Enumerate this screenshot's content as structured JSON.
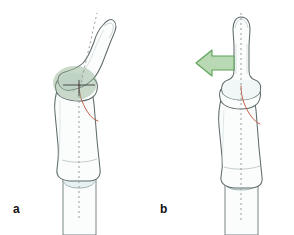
{
  "figure": {
    "type": "medical-illustration",
    "background_color": "#ffffff",
    "panels": [
      {
        "id": "a",
        "label": "a",
        "label_x": 13,
        "label_y": 203,
        "description": "Dorsally angulated distal phalanx with intra-articular fracture of the middle phalanx head; green ellipse marks the displaced joint region.",
        "state": "displaced",
        "axis": {
          "type": "dashed-reference-axis",
          "color": "#9a9a9a",
          "dash": "2,3",
          "segments": [
            {
              "name": "proximal-shaft-axis",
              "x1": 79,
              "y1": 215,
              "x2": 79,
              "y2": 92
            },
            {
              "name": "distal-phalanx-axis",
              "x1": 79,
              "y1": 92,
              "x2": 96,
              "y2": 14
            }
          ]
        },
        "highlight": {
          "shape": "ellipse",
          "cx": 75,
          "cy": 83,
          "rx": 22,
          "ry": 17,
          "fill": "#8aab8a",
          "opacity": 0.45
        },
        "fracture_line": {
          "color": "#c0624a",
          "visible": true
        },
        "marker": {
          "name": "joint-center-crosshair",
          "x": 79,
          "y": 85,
          "color": "#3c3c3c"
        }
      },
      {
        "id": "b",
        "label": "b",
        "label_x": 160,
        "label_y": 203,
        "description": "Reduced, collinear distal phalanx; green arrow indicates direction of reduction force applied to the distal fragment.",
        "state": "reduced",
        "axis": {
          "type": "dashed-reference-axis",
          "color": "#9a9a9a",
          "dash": "2,3",
          "segments": [
            {
              "name": "full-digit-axis",
              "x1": 241,
              "y1": 218,
              "x2": 241,
              "y2": 12
            }
          ]
        },
        "arrow": {
          "name": "reduction-direction-arrow",
          "direction": "left",
          "tip_x": 196,
          "tail_x": 234,
          "y": 63,
          "fill": "#b9d8b4",
          "stroke": "#5aa357"
        },
        "fracture_line": {
          "color": "#c0624a",
          "visible": true
        }
      }
    ],
    "style": {
      "bone_outline_color": "#5f6b6b",
      "bone_fill_color": "#fbfdfd",
      "cartilage_tint": "#e3eef0",
      "inner_detail_color": "#aab6b8",
      "fracture_color": "#c0624a",
      "accent_green": "#8aab8a",
      "arrow_green_fill": "#b9d8b4",
      "arrow_green_stroke": "#5aa357",
      "axis_gray": "#9a9a9a",
      "label_color": "#111111"
    }
  }
}
